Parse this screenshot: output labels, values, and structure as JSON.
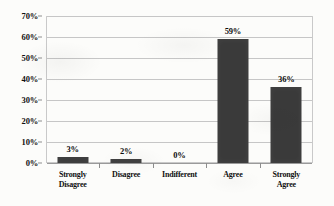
{
  "chart_data": {
    "type": "bar",
    "title": "",
    "xlabel": "",
    "ylabel": "",
    "categories": [
      "Strongly\nDisagree",
      "Disagree",
      "Indifferent",
      "Agree",
      "Strongly Agree"
    ],
    "values": [
      3,
      2,
      0,
      59,
      36
    ],
    "value_labels": [
      "3%",
      "2%",
      "0%",
      "59%",
      "36%"
    ],
    "ylim": [
      0,
      70
    ],
    "y_ticks": [
      0,
      10,
      20,
      30,
      40,
      50,
      60,
      70
    ],
    "y_tick_labels": [
      "0%",
      "10%",
      "20%",
      "30%",
      "40%",
      "50%",
      "60%",
      "70%"
    ],
    "grid": true,
    "legend": false,
    "bar_color": "#3a3a3a",
    "gridline_color": "#c6c6c6",
    "axis_color": "#9a9a9a",
    "background_color": "#fcfcfa"
  }
}
